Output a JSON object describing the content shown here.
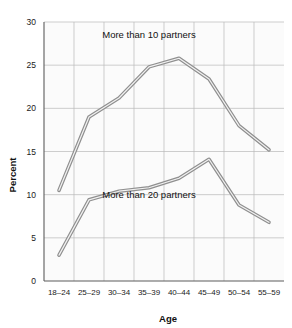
{
  "chart_data": {
    "type": "line",
    "title": "",
    "xlabel": "Age",
    "ylabel": "Percent",
    "categories": [
      "18–24",
      "25–29",
      "30–34",
      "35–39",
      "40–44",
      "45–49",
      "50–54",
      "55–59"
    ],
    "ylim": [
      0,
      30
    ],
    "yticks": [
      0,
      5,
      10,
      15,
      20,
      25,
      30
    ],
    "ytick_labels": [
      "0",
      "5",
      "10",
      "15",
      "20",
      "25",
      "30"
    ],
    "grid": true,
    "legend_position": "inline-annotation",
    "series": [
      {
        "name": "More than 10 partners",
        "label": "More than 10 partners",
        "values": [
          10.5,
          19.0,
          21.2,
          24.8,
          25.8,
          23.4,
          18.0,
          15.2
        ]
      },
      {
        "name": "More than 20 partners",
        "label": "More than 20 partners",
        "values": [
          3.0,
          9.4,
          10.4,
          10.8,
          11.9,
          14.1,
          8.8,
          6.8
        ]
      }
    ],
    "annotations": [
      {
        "text": "More than 10 partners",
        "x_category": "35–39",
        "y": 28.2
      },
      {
        "text": "More than 20 partners",
        "x_category": "35–39",
        "y": 9.6
      }
    ],
    "colors": {
      "line": "#8f8f8f",
      "line_highlight": "#f2f2f2",
      "grid": "#b9b9b9",
      "axis": "#5c5c5c",
      "plot_background": "#fbfbfb",
      "text": "#111111"
    }
  }
}
